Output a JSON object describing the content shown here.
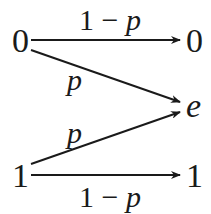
{
  "diagram": {
    "inputs": [
      {
        "id": "in0",
        "label": "0"
      },
      {
        "id": "in1",
        "label": "1"
      }
    ],
    "outputs": [
      {
        "id": "out0",
        "label": "0"
      },
      {
        "id": "oute",
        "label": "e"
      },
      {
        "id": "out1",
        "label": "1"
      }
    ],
    "edges": [
      {
        "from": "in0",
        "to": "out0",
        "label": "1 − p"
      },
      {
        "from": "in0",
        "to": "oute",
        "label": "p"
      },
      {
        "from": "in1",
        "to": "oute",
        "label": "p"
      },
      {
        "from": "in1",
        "to": "out1",
        "label": "1 − p"
      }
    ],
    "colors": {
      "ink": "#1a1a1a",
      "background": "#ffffff"
    }
  }
}
